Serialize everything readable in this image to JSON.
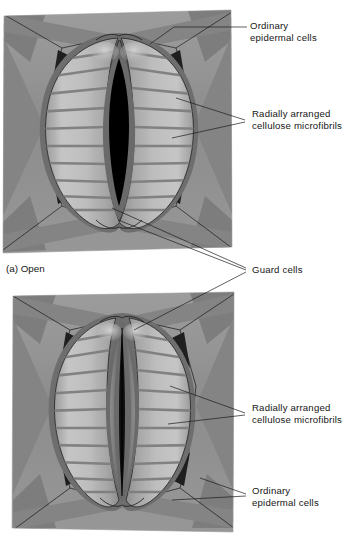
{
  "figure": {
    "style": "grayscale-illustration",
    "background": "#ffffff"
  },
  "panels": [
    {
      "id": "panel-a",
      "caption": "(a) Open",
      "state": "open",
      "pore": "wide lens-shaped aperture",
      "pore_color": "#000000",
      "frame": {
        "x": 3,
        "y": 10,
        "width": 229,
        "height": 243
      },
      "epidermis_color": "#8f8f8f",
      "guard_cell_color": "#b6b6b6",
      "wall_color": "#6f6f6f",
      "microfibril_color": "#828282",
      "microfibril_count": 12
    },
    {
      "id": "panel-b",
      "caption": "",
      "state": "closed",
      "pore": "narrow closed slit",
      "pore_color": "#111111",
      "frame": {
        "x": 12,
        "y": 292,
        "width": 222,
        "height": 240
      },
      "epidermis_color": "#8f8f8f",
      "guard_cell_color": "#b6b6b6",
      "wall_color": "#6f6f6f",
      "microfibril_color": "#828282",
      "microfibril_count": 12
    }
  ],
  "labels": {
    "ordinary_epidermal_top": {
      "line1": "Ordinary",
      "line2": "epidermal cells",
      "x": 250,
      "y": 30
    },
    "radial_microfibrils_top": {
      "line1": "Radially arranged",
      "line2": "cellulose microfibrils",
      "x": 250,
      "y": 116
    },
    "guard_cells": {
      "line1": "Guard cells",
      "x": 250,
      "y": 270
    },
    "radial_microfibrils_bottom": {
      "line1": "Radially arranged",
      "line2": "cellulose microfibrils",
      "x": 250,
      "y": 410
    },
    "ordinary_epidermal_bottom": {
      "line1": "Ordinary",
      "line2": "epidermal cells",
      "x": 250,
      "y": 497
    }
  },
  "colors": {
    "ink": "#161616",
    "epidermis": "#8f8f8f",
    "epidermis_light": "#9a9a9a",
    "guard_light": "#c2c2c2",
    "guard_mid": "#b0b0b0",
    "guard_shadow": "#8a8a8a",
    "wall_dark": "#5e5e5e",
    "wall_darkest": "#2a2a2a",
    "pore_open": "#000000",
    "pore_closed": "#141414",
    "inner_ledge": "#6b6b6b"
  }
}
